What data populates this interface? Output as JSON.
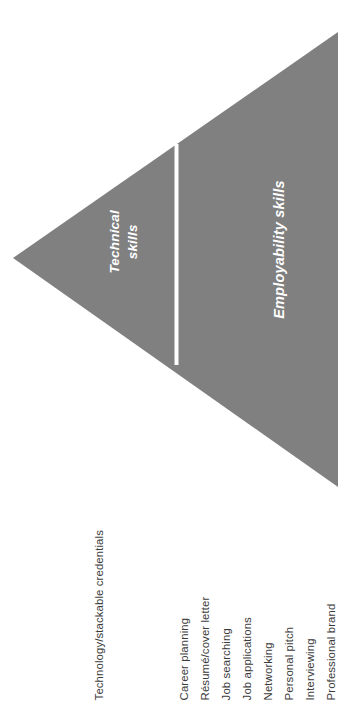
{
  "diagram": {
    "type": "funnel-triangle",
    "orientation": "left-pointing-triangle",
    "colors": {
      "fill": "#808080",
      "divider": "#ffffff",
      "segment_text": "#ffffff",
      "label_text": "#3b3b3b",
      "background": "#ffffff"
    },
    "segments": [
      {
        "id": "technical",
        "caption": "Technical\nskills",
        "caption_line_1": "Technical",
        "caption_line_2": "skills",
        "labels": [
          "Technology/stackable credentials"
        ]
      },
      {
        "id": "employability",
        "caption": "Employability skills",
        "labels": [
          "Career planning",
          "Résumé/cover letter",
          "Job searching",
          "Job applications",
          "Networking",
          "Personal pitch",
          "Interviewing",
          "Professional brand"
        ]
      }
    ],
    "geometry": {
      "apex_x": 13,
      "apex_y": 258,
      "top_right_x": 338,
      "top_right_y": 32,
      "bottom_right_x": 338,
      "bottom_right_y": 487,
      "divider_x": 176,
      "divider_top_y": 146,
      "divider_bottom_y": 363
    }
  }
}
